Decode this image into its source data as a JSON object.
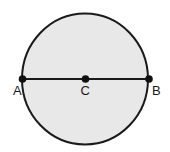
{
  "diagram": {
    "colors": {
      "fill": "#e8e8e8",
      "stroke": "#1a1a1a",
      "background": "#ffffff"
    },
    "circle": {
      "cx": 85,
      "cy": 79,
      "rx": 63,
      "ry": 65.5
    },
    "points": [
      {
        "id": "A",
        "label": "A",
        "x": 22.5,
        "y": 79,
        "label_x": 14,
        "label_y": 95
      },
      {
        "id": "C",
        "label": "C",
        "x": 85.5,
        "y": 79,
        "label_x": 81,
        "label_y": 95
      },
      {
        "id": "B",
        "label": "B",
        "x": 149,
        "y": 79,
        "label_x": 153,
        "label_y": 95
      }
    ],
    "segments": [
      {
        "from": "A",
        "to": "B",
        "name": "diameter-AB"
      }
    ]
  }
}
